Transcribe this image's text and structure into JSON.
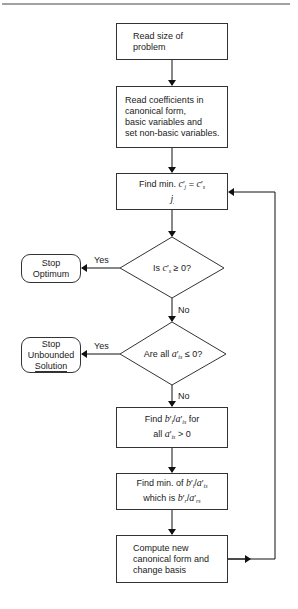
{
  "diagram": {
    "type": "flowchart",
    "title": "",
    "colors": {
      "stroke": "#333333",
      "background": "#ffffff",
      "text": "#1a1a1a"
    },
    "nodes": [
      {
        "id": "read_size",
        "shape": "process",
        "lines": [
          "Read size of",
          "problem"
        ]
      },
      {
        "id": "read_coeff",
        "shape": "process",
        "lines": [
          "Read coefficients in",
          "canonical form,",
          "basic variables and",
          "set non-basic variables."
        ]
      },
      {
        "id": "find_min_c",
        "shape": "process",
        "lines": [
          "Find min. c′j = c′s",
          "j"
        ]
      },
      {
        "id": "is_cs_nonneg",
        "shape": "decision",
        "lines": [
          "Is c′s ≥ 0?"
        ]
      },
      {
        "id": "stop_optimum",
        "shape": "terminal",
        "lines": [
          "Stop",
          "Optimum"
        ]
      },
      {
        "id": "all_ais_nonpos",
        "shape": "decision",
        "lines": [
          "Are all a′is ≤ 0?"
        ]
      },
      {
        "id": "stop_unbounded",
        "shape": "terminal",
        "lines": [
          "Stop",
          "Unbounded",
          "Solution"
        ]
      },
      {
        "id": "find_ratios",
        "shape": "process",
        "lines": [
          "Find b′i/a′is for",
          "all a′is > 0"
        ]
      },
      {
        "id": "find_min_ratio",
        "shape": "process",
        "lines": [
          "Find min. of b′i/a′is",
          "which is b′r/a′rs"
        ]
      },
      {
        "id": "compute_new",
        "shape": "process",
        "lines": [
          "Compute new",
          "canonical form and",
          "change basis"
        ]
      }
    ],
    "edges": [
      {
        "from": "read_size",
        "to": "read_coeff",
        "label": ""
      },
      {
        "from": "read_coeff",
        "to": "find_min_c",
        "label": ""
      },
      {
        "from": "find_min_c",
        "to": "is_cs_nonneg",
        "label": ""
      },
      {
        "from": "is_cs_nonneg",
        "to": "stop_optimum",
        "label": "Yes"
      },
      {
        "from": "is_cs_nonneg",
        "to": "all_ais_nonpos",
        "label": "No"
      },
      {
        "from": "all_ais_nonpos",
        "to": "stop_unbounded",
        "label": "Yes"
      },
      {
        "from": "all_ais_nonpos",
        "to": "find_ratios",
        "label": "No"
      },
      {
        "from": "find_ratios",
        "to": "find_min_ratio",
        "label": ""
      },
      {
        "from": "find_min_ratio",
        "to": "compute_new",
        "label": ""
      },
      {
        "from": "compute_new",
        "to": "find_min_c",
        "label": ""
      }
    ]
  },
  "text": {
    "read_size": [
      "Read size of",
      "problem"
    ],
    "read_coeff": [
      "Read coefficients in",
      "canonical form,",
      "basic variables and",
      "set non-basic variables."
    ],
    "find_min_c": {
      "prefix": "Find min. ",
      "c": "c",
      "j": "j",
      "eq": " = ",
      "s": "s",
      "under": "j"
    },
    "is_cs": {
      "prefix": "Is ",
      "c": "c",
      "s": "s",
      "suffix": " ≥ 0?"
    },
    "stop_optimum": [
      "Stop",
      "Optimum"
    ],
    "are_all": {
      "prefix": "Are all ",
      "a": "a",
      "is": "is",
      "suffix": " ≤ 0?"
    },
    "stop_unbounded": [
      "Stop",
      "Unbounded",
      "Solution"
    ],
    "find_ratios": {
      "l1_prefix": "Find ",
      "b": "b",
      "i": "i",
      "a": "a",
      "is": "is",
      "l1_suffix": " for",
      "l2_prefix": "all ",
      "l2_suffix": " > 0"
    },
    "find_min_ratio": {
      "l1_prefix": "Find min. of ",
      "l2_prefix": "which is ",
      "r": "r",
      "rs": "rs"
    },
    "compute_new": [
      "Compute new",
      "canonical form and",
      "change basis"
    ],
    "prime": "′",
    "slash": "/",
    "yes": "Yes",
    "no": "No"
  }
}
